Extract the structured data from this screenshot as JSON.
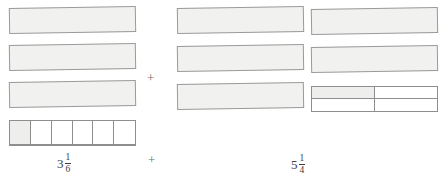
{
  "diagram": {
    "operator_symbol": "+",
    "colors": {
      "bar_fill": "#f1f1ef",
      "bar_border": "#9a9a9a",
      "shaded_part_fill": "#eeeeec",
      "background": "#ffffff",
      "text": "#3d3d3d"
    },
    "groups": [
      {
        "id": "left-group",
        "label": {
          "text": "3 1/6",
          "whole": "3",
          "numerator": "1",
          "denominator": "6"
        },
        "whole_bars": 3,
        "partitioned_bar": {
          "parts_total": 6,
          "parts_shaded": 1,
          "denominator_name": "sixths"
        },
        "bars": [
          {
            "name": "whole-bar-1",
            "type": "whole"
          },
          {
            "name": "whole-bar-2",
            "type": "whole"
          },
          {
            "name": "whole-bar-3",
            "type": "whole"
          },
          {
            "name": "partitioned-bar-sixths",
            "type": "partitioned"
          }
        ]
      },
      {
        "id": "right-group",
        "label": {
          "text": "5 1/4",
          "whole": "5",
          "numerator": "1",
          "denominator": "4"
        },
        "whole_bars": 5,
        "partitioned_bar": {
          "parts_total": 4,
          "parts_shaded": 1,
          "denominator_name": "fourths"
        },
        "bars": [
          {
            "name": "whole-bar-1",
            "type": "whole"
          },
          {
            "name": "whole-bar-2",
            "type": "whole"
          },
          {
            "name": "whole-bar-3",
            "type": "whole"
          },
          {
            "name": "whole-bar-4",
            "type": "whole"
          },
          {
            "name": "whole-bar-5",
            "type": "whole"
          },
          {
            "name": "partitioned-bar-fourths",
            "type": "partitioned"
          }
        ]
      }
    ],
    "operators": [
      {
        "name": "plus-sign-upper",
        "symbol": "+"
      },
      {
        "name": "plus-sign-lower",
        "symbol": "+"
      }
    ]
  }
}
